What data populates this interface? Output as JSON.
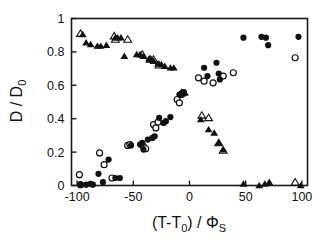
{
  "chart_data": {
    "type": "scatter",
    "title": "",
    "xlabel": "(T-T0) / ΦS",
    "xlabel_parts": {
      "main_open": "(T-T",
      "sub_zero": "0",
      "main_close": ") / ",
      "phi": "Φ",
      "sub_s": "S"
    },
    "ylabel": "D / D0",
    "ylabel_parts": {
      "main": "D / D",
      "sub_zero": "0"
    },
    "xlim": [
      -105,
      105
    ],
    "ylim": [
      0,
      1
    ],
    "xticks": [
      -100,
      -50,
      0,
      50,
      100
    ],
    "xticklabels": [
      "-100",
      "-50",
      "0",
      "50",
      "100"
    ],
    "yticks": [
      0,
      0.2,
      0.4,
      0.6,
      0.8,
      1
    ],
    "yticklabels": [
      "0",
      "0.2",
      "0.4",
      "0.6",
      "0.8",
      "1"
    ],
    "grid": false,
    "legend": "none",
    "marker_colors": {
      "filled": "#111111",
      "open_fill": "#ffffff",
      "open_stroke": "#111111"
    },
    "series": [
      {
        "name": "filled-circles",
        "marker": "filled-circle",
        "points": [
          [
            -97,
            0.005
          ],
          [
            -92,
            0.005
          ],
          [
            -88,
            0.01
          ],
          [
            -86,
            0.005
          ],
          [
            -81,
            0.07
          ],
          [
            -77,
            0.02
          ],
          [
            -72,
            0.155
          ],
          [
            -66,
            0.045
          ],
          [
            -62,
            0.045
          ],
          [
            -52,
            0.24
          ],
          [
            -44,
            0.245
          ],
          [
            -42,
            0.255
          ],
          [
            -41,
            0.215
          ],
          [
            -37,
            0.275
          ],
          [
            -33,
            0.285
          ],
          [
            -31,
            0.295
          ],
          [
            -27,
            0.405
          ],
          [
            -23,
            0.375
          ],
          [
            -21,
            0.385
          ],
          [
            -17,
            0.41
          ],
          [
            -9,
            0.545
          ],
          [
            -7,
            0.55
          ],
          [
            -6,
            0.555
          ],
          [
            -5,
            0.56
          ],
          [
            13,
            0.705
          ],
          [
            16,
            0.655
          ],
          [
            24,
            0.735
          ],
          [
            26,
            0.67
          ],
          [
            27,
            0.635
          ],
          [
            48,
            0.885
          ],
          [
            64,
            0.89
          ],
          [
            68,
            0.885
          ],
          [
            70,
            0.84
          ],
          [
            97,
            0.89
          ]
        ]
      },
      {
        "name": "open-circles",
        "marker": "open-circle",
        "points": [
          [
            -98,
            0.065
          ],
          [
            -97,
            0.005
          ],
          [
            -80,
            0.195
          ],
          [
            -76,
            0.125
          ],
          [
            -69,
            0.045
          ],
          [
            -55,
            0.24
          ],
          [
            -53,
            0.245
          ],
          [
            -41,
            0.235
          ],
          [
            -39,
            0.22
          ],
          [
            -32,
            0.365
          ],
          [
            -30,
            0.345
          ],
          [
            -28,
            0.38
          ],
          [
            -11,
            0.515
          ],
          [
            -9,
            0.495
          ],
          [
            -7,
            0.545
          ],
          [
            8,
            0.645
          ],
          [
            13,
            0.625
          ],
          [
            21,
            0.615
          ],
          [
            30,
            0.655
          ],
          [
            39,
            0.675
          ],
          [
            94,
            0.765
          ]
        ]
      },
      {
        "name": "filled-triangles",
        "marker": "filled-triangle",
        "points": [
          [
            -95,
            0.905
          ],
          [
            -92,
            0.855
          ],
          [
            -88,
            0.845
          ],
          [
            -82,
            0.835
          ],
          [
            -79,
            0.835
          ],
          [
            -74,
            0.84
          ],
          [
            -66,
            0.885
          ],
          [
            -64,
            0.885
          ],
          [
            -61,
            0.885
          ],
          [
            -58,
            0.775
          ],
          [
            -47,
            0.785
          ],
          [
            -44,
            0.785
          ],
          [
            -41,
            0.775
          ],
          [
            -36,
            0.76
          ],
          [
            -34,
            0.755
          ],
          [
            -32,
            0.745
          ],
          [
            -28,
            0.73
          ],
          [
            -25,
            0.725
          ],
          [
            -22,
            0.715
          ],
          [
            -17,
            0.705
          ],
          [
            -14,
            0.705
          ],
          [
            -5,
            0.555
          ],
          [
            -4,
            0.555
          ],
          [
            10,
            0.395
          ],
          [
            17,
            0.335
          ],
          [
            22,
            0.315
          ],
          [
            26,
            0.255
          ],
          [
            30,
            0.215
          ],
          [
            48,
            0.01
          ],
          [
            62,
            0.0
          ],
          [
            67,
            0.01
          ],
          [
            71,
            0.02
          ],
          [
            99,
            0.0
          ]
        ]
      },
      {
        "name": "open-triangles",
        "marker": "open-triangle",
        "points": [
          [
            -97,
            0.91
          ],
          [
            -67,
            0.895
          ],
          [
            -66,
            0.875
          ],
          [
            -55,
            0.875
          ],
          [
            -42,
            0.785
          ],
          [
            -35,
            0.755
          ],
          [
            -32,
            0.755
          ],
          [
            -27,
            0.72
          ],
          [
            -7,
            0.555
          ],
          [
            11,
            0.42
          ],
          [
            17,
            0.405
          ],
          [
            26,
            0.255
          ],
          [
            30,
            0.21
          ],
          [
            94,
            0.02
          ]
        ]
      }
    ]
  }
}
